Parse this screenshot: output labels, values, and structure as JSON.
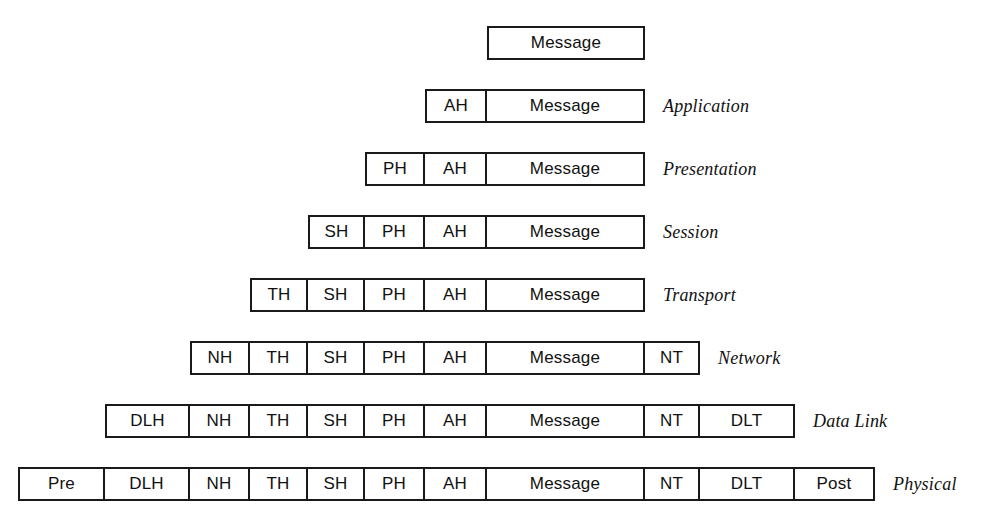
{
  "diagram": {
    "geometry": {
      "row_height": 34,
      "row_tops": [
        26,
        89,
        152,
        215,
        278,
        341,
        404,
        467
      ],
      "columns": {
        "pre": {
          "left": 18,
          "width": 87
        },
        "dlh": {
          "left": 105,
          "width": 85
        },
        "nh": {
          "left": 190,
          "width": 60
        },
        "th": {
          "left": 250,
          "width": 58
        },
        "sh": {
          "left": 308,
          "width": 57
        },
        "ph": {
          "left": 365,
          "width": 60
        },
        "ah": {
          "left": 425,
          "width": 62
        },
        "message": {
          "left": 487,
          "width": 158
        },
        "nt": {
          "left": 645,
          "width": 55
        },
        "dlt": {
          "left": 700,
          "width": 95
        },
        "post": {
          "left": 795,
          "width": 80
        }
      },
      "label_gap": 18
    },
    "colors": {
      "border": "#1a1a1a",
      "text": "#111111",
      "background": "#ffffff"
    },
    "rows": [
      {
        "layer": "",
        "cells": [
          {
            "key": "message",
            "label": "Message"
          }
        ]
      },
      {
        "layer": "Application",
        "cells": [
          {
            "key": "ah",
            "label": "AH"
          },
          {
            "key": "message",
            "label": "Message"
          }
        ]
      },
      {
        "layer": "Presentation",
        "cells": [
          {
            "key": "ph",
            "label": "PH"
          },
          {
            "key": "ah",
            "label": "AH"
          },
          {
            "key": "message",
            "label": "Message"
          }
        ]
      },
      {
        "layer": "Session",
        "cells": [
          {
            "key": "sh",
            "label": "SH"
          },
          {
            "key": "ph",
            "label": "PH"
          },
          {
            "key": "ah",
            "label": "AH"
          },
          {
            "key": "message",
            "label": "Message"
          }
        ]
      },
      {
        "layer": "Transport",
        "cells": [
          {
            "key": "th",
            "label": "TH"
          },
          {
            "key": "sh",
            "label": "SH"
          },
          {
            "key": "ph",
            "label": "PH"
          },
          {
            "key": "ah",
            "label": "AH"
          },
          {
            "key": "message",
            "label": "Message"
          }
        ]
      },
      {
        "layer": "Network",
        "cells": [
          {
            "key": "nh",
            "label": "NH"
          },
          {
            "key": "th",
            "label": "TH"
          },
          {
            "key": "sh",
            "label": "SH"
          },
          {
            "key": "ph",
            "label": "PH"
          },
          {
            "key": "ah",
            "label": "AH"
          },
          {
            "key": "message",
            "label": "Message"
          },
          {
            "key": "nt",
            "label": "NT"
          }
        ]
      },
      {
        "layer": "Data Link",
        "cells": [
          {
            "key": "dlh",
            "label": "DLH"
          },
          {
            "key": "nh",
            "label": "NH"
          },
          {
            "key": "th",
            "label": "TH"
          },
          {
            "key": "sh",
            "label": "SH"
          },
          {
            "key": "ph",
            "label": "PH"
          },
          {
            "key": "ah",
            "label": "AH"
          },
          {
            "key": "message",
            "label": "Message"
          },
          {
            "key": "nt",
            "label": "NT"
          },
          {
            "key": "dlt",
            "label": "DLT"
          }
        ]
      },
      {
        "layer": "Physical",
        "cells": [
          {
            "key": "pre",
            "label": "Pre"
          },
          {
            "key": "dlh",
            "label": "DLH"
          },
          {
            "key": "nh",
            "label": "NH"
          },
          {
            "key": "th",
            "label": "TH"
          },
          {
            "key": "sh",
            "label": "SH"
          },
          {
            "key": "ph",
            "label": "PH"
          },
          {
            "key": "ah",
            "label": "AH"
          },
          {
            "key": "message",
            "label": "Message"
          },
          {
            "key": "nt",
            "label": "NT"
          },
          {
            "key": "dlt",
            "label": "DLT"
          },
          {
            "key": "post",
            "label": "Post"
          }
        ]
      }
    ]
  }
}
